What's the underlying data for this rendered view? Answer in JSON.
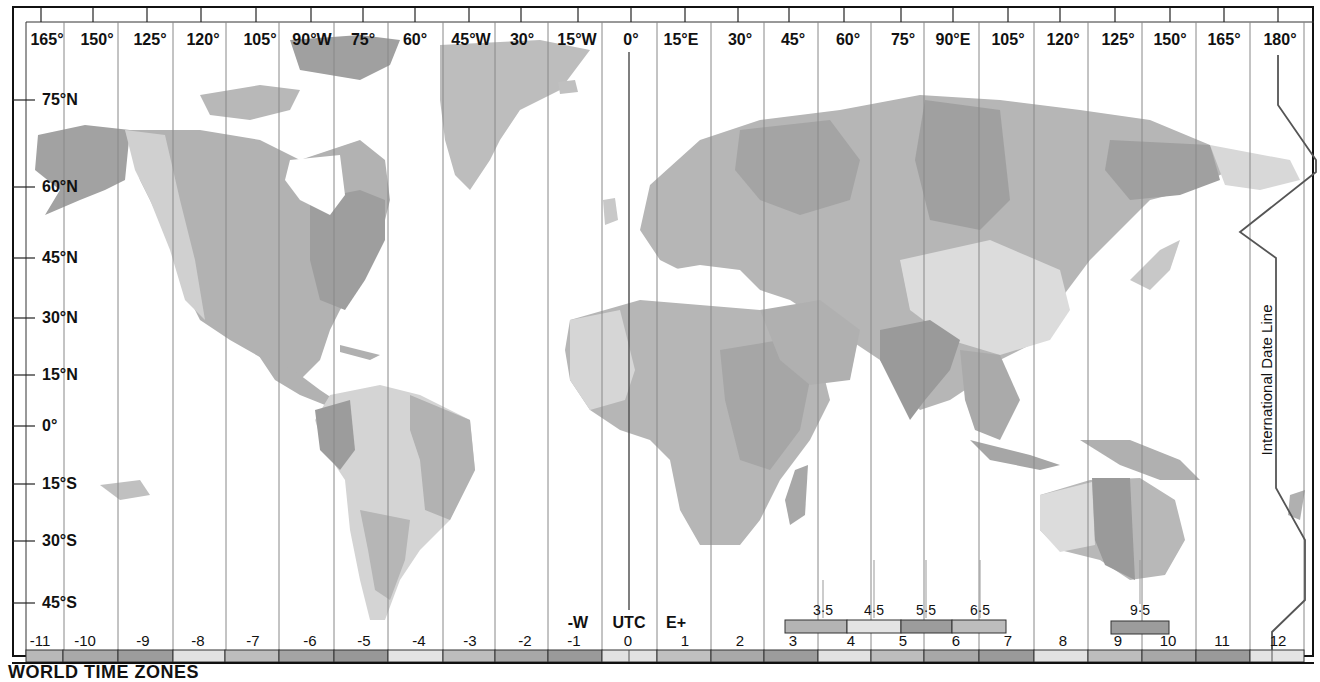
{
  "title": "WORLD TIME ZONES",
  "longitude_labels": [
    {
      "label": "165°",
      "x": 47
    },
    {
      "label": "150°",
      "x": 97
    },
    {
      "label": "125°",
      "x": 150
    },
    {
      "label": "120°",
      "x": 203
    },
    {
      "label": "105°",
      "x": 260
    },
    {
      "label": "90°W",
      "x": 312
    },
    {
      "label": "75°",
      "x": 363
    },
    {
      "label": "60°",
      "x": 415
    },
    {
      "label": "45°W",
      "x": 471
    },
    {
      "label": "30°",
      "x": 522
    },
    {
      "label": "15°W",
      "x": 577
    },
    {
      "label": "0°",
      "x": 631
    },
    {
      "label": "15°E",
      "x": 681
    },
    {
      "label": "30°",
      "x": 740
    },
    {
      "label": "45°",
      "x": 793
    },
    {
      "label": "60°",
      "x": 848
    },
    {
      "label": "75°",
      "x": 903
    },
    {
      "label": "90°E",
      "x": 953
    },
    {
      "label": "105°",
      "x": 1008
    },
    {
      "label": "120°",
      "x": 1063
    },
    {
      "label": "125°",
      "x": 1118
    },
    {
      "label": "150°",
      "x": 1170
    },
    {
      "label": "165°",
      "x": 1224
    },
    {
      "label": "180°",
      "x": 1280
    }
  ],
  "latitude_labels": [
    {
      "label": "75°N",
      "y": 100
    },
    {
      "label": "60°N",
      "y": 187
    },
    {
      "label": "45°N",
      "y": 258
    },
    {
      "label": "30°N",
      "y": 318
    },
    {
      "label": "15°N",
      "y": 375
    },
    {
      "label": "0°",
      "y": 426
    },
    {
      "label": "15°S",
      "y": 484
    },
    {
      "label": "30°S",
      "y": 541
    },
    {
      "label": "45°S",
      "y": 603
    }
  ],
  "zone_offsets": [
    {
      "label": "-11",
      "x": 40
    },
    {
      "label": "-10",
      "x": 85
    },
    {
      "label": "-9",
      "x": 143
    },
    {
      "label": "-8",
      "x": 198
    },
    {
      "label": "-7",
      "x": 253
    },
    {
      "label": "-6",
      "x": 310
    },
    {
      "label": "-5",
      "x": 364
    },
    {
      "label": "-4",
      "x": 419
    },
    {
      "label": "-3",
      "x": 470
    },
    {
      "label": "-2",
      "x": 525
    },
    {
      "label": "-1",
      "x": 574
    },
    {
      "label": "0",
      "x": 628
    },
    {
      "label": "1",
      "x": 685
    },
    {
      "label": "2",
      "x": 740
    },
    {
      "label": "3",
      "x": 793
    },
    {
      "label": "4",
      "x": 851
    },
    {
      "label": "5",
      "x": 903
    },
    {
      "label": "6",
      "x": 956
    },
    {
      "label": "7",
      "x": 1008
    },
    {
      "label": "8",
      "x": 1063
    },
    {
      "label": "9",
      "x": 1118
    },
    {
      "label": "10",
      "x": 1168
    },
    {
      "label": "11",
      "x": 1222
    },
    {
      "label": "12",
      "x": 1278
    }
  ],
  "half_hour_labels": [
    {
      "label": "3·5",
      "x": 823
    },
    {
      "label": "4·5",
      "x": 874
    },
    {
      "label": "5·5",
      "x": 926
    },
    {
      "label": "6·5",
      "x": 980
    },
    {
      "label": "9·5",
      "x": 1140
    }
  ],
  "markers": {
    "west": "-W",
    "utc": "UTC",
    "east": "E+"
  },
  "date_line_label": "International Date Line",
  "colors": {
    "shade_light": "#e6e6e6",
    "shade_mid": "#c4c4c4",
    "shade_medium": "#b0b0b0",
    "shade_dark": "#9a9a9a",
    "line": "#555555",
    "frame": "#111111"
  },
  "bottom_bar_shades": [
    "#b8b8b8",
    "#a9a9a9",
    "#9c9c9c",
    "#e2e2e2",
    "#bdbdbd",
    "#a4a4a4",
    "#989898",
    "#e4e4e4",
    "#bdbdbd",
    "#a8a8a8",
    "#9a9a9a",
    "#e2e2e2",
    "#c0c0c0",
    "#a9a9a9",
    "#9c9c9c",
    "#e2e2e2",
    "#bdbdbd",
    "#a8a8a8",
    "#9a9a9a",
    "#e2e2e2",
    "#bdbdbd",
    "#a8a8a8",
    "#9a9a9a",
    "#e4e4e4"
  ]
}
